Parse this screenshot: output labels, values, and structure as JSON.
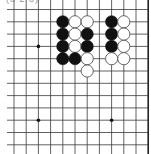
{
  "caption": "(8 2 3)",
  "board": {
    "origin_x": 14,
    "origin_y": 9.5,
    "step_x": 12.2,
    "step_y": 12.3,
    "cols": 12,
    "rows": 12,
    "right_edge_col": 11,
    "line_color": "#3a3a3a",
    "edge_color": "#222222",
    "stone_radius": 6.1,
    "black_color": "#111111",
    "white_fill": "#ffffff",
    "white_stroke": "#555555",
    "star_points": [
      {
        "col": 2,
        "row": 3
      },
      {
        "col": 2,
        "row": 9
      },
      {
        "col": 8,
        "row": 9
      }
    ],
    "stones": [
      {
        "col": 4,
        "row": 1,
        "color": "black"
      },
      {
        "col": 5,
        "row": 1,
        "color": "white"
      },
      {
        "col": 6,
        "row": 1,
        "color": "white"
      },
      {
        "col": 8,
        "row": 1,
        "color": "black"
      },
      {
        "col": 9,
        "row": 1,
        "color": "white"
      },
      {
        "col": 4,
        "row": 2,
        "color": "black"
      },
      {
        "col": 5,
        "row": 2,
        "color": "white"
      },
      {
        "col": 6,
        "row": 2,
        "color": "black"
      },
      {
        "col": 8,
        "row": 2,
        "color": "black"
      },
      {
        "col": 9,
        "row": 2,
        "color": "white"
      },
      {
        "col": 4,
        "row": 3,
        "color": "black"
      },
      {
        "col": 5,
        "row": 3,
        "color": "white"
      },
      {
        "col": 6,
        "row": 3,
        "color": "black"
      },
      {
        "col": 8,
        "row": 3,
        "color": "black"
      },
      {
        "col": 9,
        "row": 3,
        "color": "white"
      },
      {
        "col": 4,
        "row": 4,
        "color": "black"
      },
      {
        "col": 5,
        "row": 4,
        "color": "black"
      },
      {
        "col": 6,
        "row": 4,
        "color": "white"
      },
      {
        "col": 8,
        "row": 4,
        "color": "white"
      },
      {
        "col": 9,
        "row": 4,
        "color": "white"
      },
      {
        "col": 6,
        "row": 5,
        "color": "white"
      }
    ]
  }
}
